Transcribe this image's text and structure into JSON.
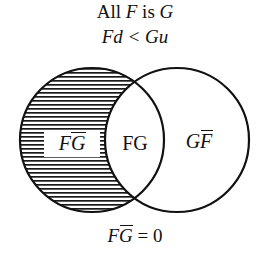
{
  "figure": {
    "caption_top": {
      "prefix": "All",
      "term_f": "F",
      "connector": "is",
      "term_g": "G"
    },
    "caption_sub": {
      "left": "Fd",
      "operator": "<",
      "right": "Gu"
    },
    "caption_bottom": {
      "term": "F",
      "term_bar": "G",
      "operator": "=",
      "value": "0"
    },
    "regions": {
      "left_label": {
        "base": "F",
        "barred": "G"
      },
      "middle_label": "FG",
      "right_label": {
        "base": "G",
        "barred": "F"
      }
    },
    "style": {
      "stroke": "#111111",
      "hatch_color": "#1a1a1a",
      "background": "#ffffff",
      "stroke_width": "2.2",
      "hatch_spacing": "4"
    },
    "geometry": {
      "left_circle": {
        "cx": "92",
        "cy": "140",
        "r": "72"
      },
      "right_circle": {
        "cx": "177",
        "cy": "140",
        "r": "72"
      }
    }
  }
}
